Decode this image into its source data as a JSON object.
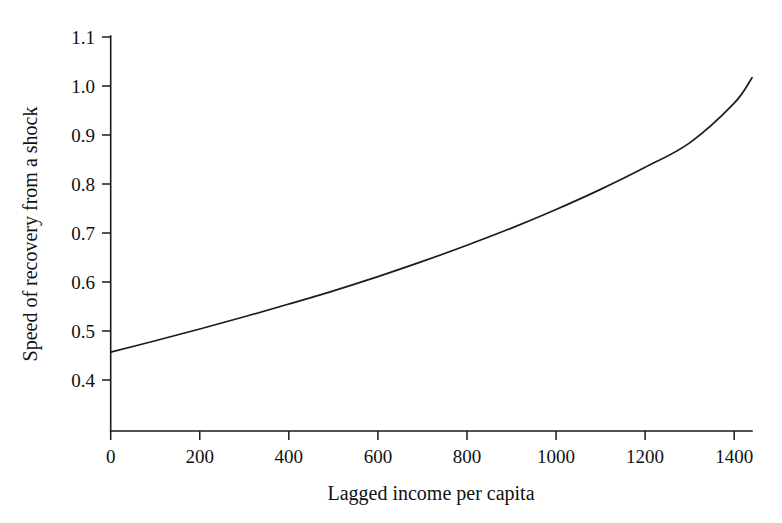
{
  "chart_data": {
    "type": "line",
    "title": "",
    "xlabel": "Lagged income per capita",
    "ylabel": "Speed of recovery from a shock",
    "xlim": [
      0,
      1440
    ],
    "ylim": [
      0.33,
      1.12
    ],
    "grid": false,
    "legend": null,
    "xticks": [
      0,
      200,
      400,
      600,
      800,
      1000,
      1200,
      1400
    ],
    "xticklabels": [
      "0",
      "200",
      "400",
      "600",
      "800",
      "1000",
      "1200",
      "1400"
    ],
    "yticks": [
      0.4,
      0.5,
      0.6,
      0.7,
      0.8,
      0.9,
      1.0,
      1.1
    ],
    "yticklabels": [
      "0.4",
      "0.5",
      "0.6",
      "0.7",
      "0.8",
      "0.9",
      "1.0",
      "1.1"
    ],
    "series": [
      {
        "name": "Speed of recovery",
        "color": "#1c1c1c",
        "x": [
          0,
          100,
          200,
          300,
          400,
          500,
          600,
          700,
          800,
          900,
          1000,
          1100,
          1200,
          1300,
          1400,
          1440
        ],
        "y": [
          0.457,
          0.48,
          0.504,
          0.529,
          0.555,
          0.582,
          0.611,
          0.642,
          0.675,
          0.71,
          0.748,
          0.789,
          0.834,
          0.884,
          0.965,
          1.017
        ]
      }
    ]
  },
  "axes": {
    "x_axis_name": "x-axis",
    "y_axis_name": "y-axis"
  }
}
